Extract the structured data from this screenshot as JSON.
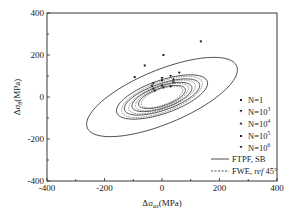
{
  "chart_data": {
    "type": "scatter",
    "title": "",
    "xlabel": "Δσ_ax (MPa)",
    "xlabel_main": "Δσ",
    "xlabel_sub": "ax",
    "xlabel_unit": "(MPa)",
    "ylabel": "Δτ_a0 (MPa)",
    "ylabel_main": "Δσ",
    "ylabel_sub": "θ",
    "ylabel_unit": "(MPa)",
    "xlim": [
      -400,
      400
    ],
    "ylim": [
      -400,
      400
    ],
    "xticks": [
      -400,
      -200,
      0,
      200,
      400
    ],
    "yticks": [
      -400,
      -200,
      0,
      200,
      400
    ],
    "xtick_labels": [
      "-400",
      "-200",
      "0",
      "200",
      "400"
    ],
    "ytick_labels": [
      "400",
      "200",
      "0",
      "-200",
      "-400"
    ],
    "grid": false,
    "legend_position": "lower right",
    "series": [
      {
        "name": "N=1",
        "label_main": "N=1",
        "label_sup": "",
        "marker": "square",
        "ellipse": {
          "a": 300,
          "b": 120,
          "angle_deg": 32
        },
        "points": [
          [
            -95,
            95
          ],
          [
            -60,
            150
          ],
          [
            5,
            200
          ],
          [
            135,
            265
          ]
        ]
      },
      {
        "name": "N=10^3",
        "label_main": "N=10",
        "label_sup": "3",
        "marker": "triangle-down",
        "ellipse": {
          "a": 175,
          "b": 75,
          "angle_deg": 28
        },
        "points": [
          [
            -30,
            65
          ],
          [
            0,
            90
          ],
          [
            30,
            100
          ],
          [
            60,
            115
          ]
        ]
      },
      {
        "name": "N=10^4",
        "label_main": "N=10",
        "label_sup": "4",
        "marker": "triangle-up",
        "ellipse": {
          "a": 145,
          "b": 60,
          "angle_deg": 28
        },
        "points": [
          [
            -35,
            55
          ],
          [
            0,
            80
          ],
          [
            40,
            85
          ]
        ]
      },
      {
        "name": "N=10^5",
        "label_main": "N=10",
        "label_sup": "5",
        "marker": "square",
        "ellipse": {
          "a": 115,
          "b": 50,
          "angle_deg": 28
        },
        "points": [
          [
            -30,
            40
          ],
          [
            0,
            55
          ],
          [
            40,
            70
          ]
        ]
      },
      {
        "name": "N=10^6",
        "label_main": "N=10",
        "label_sup": "6",
        "marker": "triangle-down",
        "ellipse": {
          "a": 90,
          "b": 40,
          "angle_deg": 28
        },
        "points": [
          [
            -25,
            30
          ],
          [
            5,
            45
          ],
          [
            30,
            50
          ]
        ]
      }
    ],
    "lines": [
      {
        "name": "FTPF, SB",
        "style": "solid"
      },
      {
        "name": "FWE, ref 45°",
        "style": "dashed"
      }
    ]
  },
  "legend": {
    "items": [
      {
        "main": "N=1",
        "sup": ""
      },
      {
        "main": "N=10",
        "sup": "3"
      },
      {
        "main": "N=10",
        "sup": "4"
      },
      {
        "main": "N=10",
        "sup": "5"
      },
      {
        "main": "N=10",
        "sup": "6"
      }
    ],
    "line_solid": "FTPF, SB",
    "line_dashed_main": "FWE, ",
    "line_dashed_ital": "ref",
    "line_dashed_tail": " 45°"
  }
}
